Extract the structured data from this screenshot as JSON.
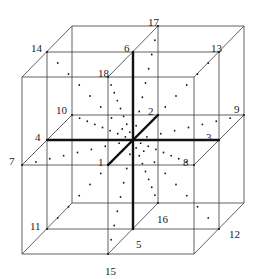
{
  "diagram": {
    "center": [
      133,
      140
    ],
    "edges": [
      [
        [
          22,
          77
        ],
        [
          194,
          77
        ]
      ],
      [
        [
          194,
          77
        ],
        [
          194,
          254
        ]
      ],
      [
        [
          194,
          254
        ],
        [
          22,
          254
        ]
      ],
      [
        [
          22,
          254
        ],
        [
          22,
          77
        ]
      ],
      [
        [
          72,
          26
        ],
        [
          244,
          26
        ]
      ],
      [
        [
          244,
          26
        ],
        [
          244,
          203
        ]
      ],
      [
        [
          244,
          203
        ],
        [
          72,
          203
        ]
      ],
      [
        [
          72,
          203
        ],
        [
          72,
          26
        ]
      ],
      [
        [
          22,
          77
        ],
        [
          72,
          26
        ]
      ],
      [
        [
          194,
          77
        ],
        [
          244,
          26
        ]
      ],
      [
        [
          194,
          254
        ],
        [
          244,
          203
        ]
      ],
      [
        [
          22,
          254
        ],
        [
          72,
          203
        ]
      ],
      [
        [
          47,
          52
        ],
        [
          219,
          52
        ]
      ],
      [
        [
          219,
          52
        ],
        [
          219,
          229
        ]
      ],
      [
        [
          219,
          229
        ],
        [
          47,
          229
        ]
      ],
      [
        [
          47,
          229
        ],
        [
          47,
          52
        ]
      ],
      [
        [
          22,
          165
        ],
        [
          194,
          165
        ]
      ],
      [
        [
          72,
          115
        ],
        [
          244,
          115
        ]
      ],
      [
        [
          22,
          165
        ],
        [
          72,
          115
        ]
      ],
      [
        [
          194,
          165
        ],
        [
          244,
          115
        ]
      ],
      [
        [
          108,
          77
        ],
        [
          108,
          254
        ]
      ],
      [
        [
          158,
          26
        ],
        [
          158,
          203
        ]
      ],
      [
        [
          108,
          77
        ],
        [
          158,
          26
        ]
      ],
      [
        [
          108,
          254
        ],
        [
          158,
          203
        ]
      ]
    ],
    "axes": [
      {
        "from": "1",
        "to": "2"
      },
      {
        "from": "3",
        "to": "4"
      },
      {
        "from": "5",
        "to": "6"
      }
    ],
    "points": [
      {
        "id": "1",
        "x": 108,
        "y": 165,
        "lx": 98,
        "ly": 162
      },
      {
        "id": "2",
        "x": 158,
        "y": 115,
        "lx": 148,
        "ly": 111
      },
      {
        "id": "3",
        "x": 219,
        "y": 140,
        "lx": 206,
        "ly": 137
      },
      {
        "id": "4",
        "x": 47,
        "y": 140,
        "lx": 35,
        "ly": 137
      },
      {
        "id": "5",
        "x": 133,
        "y": 229,
        "lx": 136,
        "ly": 244
      },
      {
        "id": "6",
        "x": 133,
        "y": 52,
        "lx": 124,
        "ly": 48
      },
      {
        "id": "7",
        "x": 22,
        "y": 165,
        "lx": 9,
        "ly": 161
      },
      {
        "id": "8",
        "x": 194,
        "y": 165,
        "lx": 183,
        "ly": 162
      },
      {
        "id": "9",
        "x": 244,
        "y": 115,
        "lx": 234,
        "ly": 109
      },
      {
        "id": "10",
        "x": 72,
        "y": 115,
        "lx": 56,
        "ly": 110
      },
      {
        "id": "11",
        "x": 47,
        "y": 229,
        "lx": 30,
        "ly": 226
      },
      {
        "id": "12",
        "x": 219,
        "y": 229,
        "lx": 229,
        "ly": 234
      },
      {
        "id": "13",
        "x": 219,
        "y": 52,
        "lx": 211,
        "ly": 48
      },
      {
        "id": "14",
        "x": 47,
        "y": 52,
        "lx": 31,
        "ly": 48
      },
      {
        "id": "15",
        "x": 108,
        "y": 254,
        "lx": 105,
        "ly": 271
      },
      {
        "id": "16",
        "x": 158,
        "y": 203,
        "lx": 157,
        "ly": 219
      },
      {
        "id": "17",
        "x": 158,
        "y": 26,
        "lx": 148,
        "ly": 22
      },
      {
        "id": "18",
        "x": 108,
        "y": 77,
        "lx": 98,
        "ly": 73
      }
    ],
    "dots_per_line": 7
  }
}
